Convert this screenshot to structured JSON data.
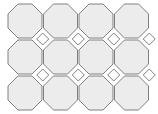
{
  "figure": {
    "width": 158,
    "height": 114,
    "background_color": "#ffffff"
  },
  "pattern": {
    "type": "truncated-square-tiling",
    "tile_shape": "octagon",
    "gap_shape": "square",
    "columns": 4,
    "rows": 3,
    "cell_pitch_x": 35.5,
    "cell_pitch_y": 36.0,
    "octagon_width": 34,
    "octagon_height": 34,
    "octagon_corner_cut": 10,
    "gap_diagonal": 12,
    "first_center_x": 25,
    "first_center_y": 21,
    "clipped_edges": [
      "right",
      "bottom"
    ]
  },
  "colors": {
    "octagon_fill": "#ececec",
    "octagon_stroke": "#808080",
    "gap_fill": "#ffffff",
    "gap_stroke": "#808080",
    "stroke_width": 1
  },
  "octagon_centers": [
    {
      "cx": 25,
      "cy": 21
    },
    {
      "cx": 60.5,
      "cy": 21
    },
    {
      "cx": 96,
      "cy": 21
    },
    {
      "cx": 131.5,
      "cy": 21
    },
    {
      "cx": 25,
      "cy": 57
    },
    {
      "cx": 60.5,
      "cy": 57
    },
    {
      "cx": 96,
      "cy": 57
    },
    {
      "cx": 131.5,
      "cy": 57
    },
    {
      "cx": 25,
      "cy": 93
    },
    {
      "cx": 60.5,
      "cy": 93
    },
    {
      "cx": 96,
      "cy": 93
    },
    {
      "cx": 131.5,
      "cy": 93
    }
  ],
  "gap_centers": [
    {
      "cx": 42.75,
      "cy": 39
    },
    {
      "cx": 78.25,
      "cy": 39
    },
    {
      "cx": 113.75,
      "cy": 39
    },
    {
      "cx": 149.25,
      "cy": 39
    },
    {
      "cx": 42.75,
      "cy": 75
    },
    {
      "cx": 78.25,
      "cy": 75
    },
    {
      "cx": 113.75,
      "cy": 75
    },
    {
      "cx": 149.25,
      "cy": 75
    }
  ]
}
